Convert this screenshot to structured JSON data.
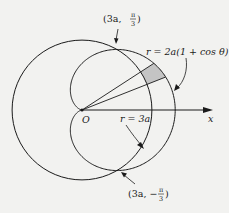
{
  "figure": {
    "background_color": "#f2f2f0",
    "line_color": "#1a1a1a",
    "shade_color": "#c4c4c4"
  },
  "labels": {
    "origin": "O",
    "x_axis": "x",
    "cardioid_eq": "r = 2a(1 + cos θ)",
    "circle_eq": "r = 3a",
    "upper_intersection": {
      "prefix": "(3a, ",
      "num": "π",
      "den": "3",
      "suffix": ")"
    },
    "lower_intersection": {
      "prefix": "(3a, −",
      "num": "π",
      "den": "3",
      "suffix": ")"
    }
  },
  "geometry": {
    "origin_px": [
      82,
      110
    ],
    "a_px": 23.3,
    "circle_radius": "3a",
    "cardioid": "2a(1 + cos θ)",
    "intersections": [
      "(3a, π/3)",
      "(3a, −π/3)"
    ],
    "shaded_wedge_angles_deg": [
      21.5,
      33
    ]
  }
}
